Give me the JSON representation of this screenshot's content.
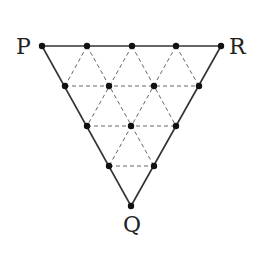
{
  "diagram": {
    "type": "triangular-lattice",
    "colors": {
      "background": "#ffffff",
      "edges": "#333333",
      "dashed": "#555555",
      "dots": "#111111"
    },
    "labels": {
      "P": "P",
      "R": "R",
      "Q": "Q"
    },
    "vertices": {
      "P": {
        "x": 42,
        "y": 46
      },
      "R": {
        "x": 221,
        "y": 46
      },
      "Q": {
        "x": 131,
        "y": 206
      }
    },
    "points": [
      {
        "x": 42,
        "y": 46
      },
      {
        "x": 87,
        "y": 46
      },
      {
        "x": 132,
        "y": 46
      },
      {
        "x": 176,
        "y": 46
      },
      {
        "x": 221,
        "y": 46
      },
      {
        "x": 65,
        "y": 86
      },
      {
        "x": 109,
        "y": 86
      },
      {
        "x": 154,
        "y": 86
      },
      {
        "x": 199,
        "y": 86
      },
      {
        "x": 87,
        "y": 126
      },
      {
        "x": 131,
        "y": 126
      },
      {
        "x": 176,
        "y": 126
      },
      {
        "x": 109,
        "y": 166
      },
      {
        "x": 154,
        "y": 166
      },
      {
        "x": 131,
        "y": 206
      }
    ],
    "solid_edges": [
      [
        "P",
        "R"
      ],
      [
        "R",
        "Q"
      ],
      [
        "Q",
        "P"
      ]
    ],
    "point_count": 15
  }
}
